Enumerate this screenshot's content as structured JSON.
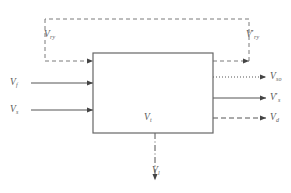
{
  "figure": {
    "type": "block-flow-diagram",
    "background_color": "#ffffff",
    "line_color": "#555555",
    "box_border_color": "#666666",
    "label_color": "#5a5a5a"
  },
  "system_box": {
    "label_base": "V",
    "label_sub": "t",
    "x": 93,
    "y": 53,
    "width": 120,
    "height": 80,
    "stroke": "#666666",
    "fill": "#ffffff"
  },
  "recycle_loop": {
    "style": "dashed",
    "inlet_label": {
      "base": "V",
      "sub": "ry",
      "prime": ""
    },
    "outlet_label": {
      "base": "V",
      "sub": "ry",
      "prime": "′"
    }
  },
  "inputs": [
    {
      "base": "V",
      "sub": "f",
      "prime": "",
      "style": "solid",
      "y": 83
    },
    {
      "base": "V",
      "sub": "s",
      "prime": "",
      "style": "solid",
      "y": 110
    }
  ],
  "outputs": [
    {
      "base": "V",
      "sub": "so",
      "prime": "",
      "style": "dotted",
      "y": 77
    },
    {
      "base": "V",
      "sub": "s",
      "prime": "′",
      "style": "solid",
      "y": 98
    },
    {
      "base": "V",
      "sub": "d",
      "prime": "",
      "style": "dashed",
      "y": 118
    }
  ],
  "bottom_outlet": {
    "base": "V",
    "sub": "l",
    "prime": "",
    "style": "dash-dot"
  }
}
